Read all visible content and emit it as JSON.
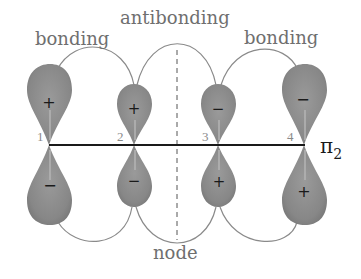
{
  "labels": {
    "bonding_left": "bonding",
    "antibonding": "antibonding",
    "bonding_right": "bonding",
    "node": "node",
    "orbital": "π",
    "orbital_subscript": "2"
  },
  "atoms": [
    {
      "number": "1",
      "top_sign": "+",
      "bottom_sign": "−",
      "size": "large"
    },
    {
      "number": "2",
      "top_sign": "+",
      "bottom_sign": "−",
      "size": "small"
    },
    {
      "number": "3",
      "top_sign": "−",
      "bottom_sign": "+",
      "size": "small"
    },
    {
      "number": "4",
      "top_sign": "−",
      "bottom_sign": "+",
      "size": "large"
    }
  ],
  "colors": {
    "lobe_fill": "#8c8c8c",
    "lobe_highlight": "#b5b5b5",
    "connector": "#8a8a8a",
    "axis": "#1a1a1a",
    "node_line": "#555555"
  }
}
